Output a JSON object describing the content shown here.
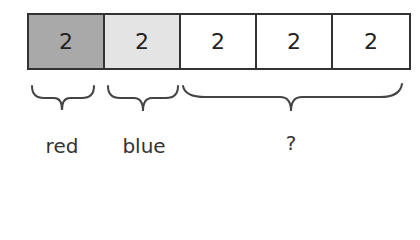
{
  "cells": [
    {
      "value": "2",
      "fill": "#a9a9a9",
      "group": "red"
    },
    {
      "value": "2",
      "fill": "#e4e4e4",
      "group": "blue"
    },
    {
      "value": "2",
      "fill": "#ffffff",
      "group": "unknown"
    },
    {
      "value": "2",
      "fill": "#ffffff",
      "group": "unknown"
    },
    {
      "value": "2",
      "fill": "#ffffff",
      "group": "unknown"
    }
  ],
  "labels": {
    "red": "red",
    "blue": "blue",
    "unknown": "?"
  }
}
